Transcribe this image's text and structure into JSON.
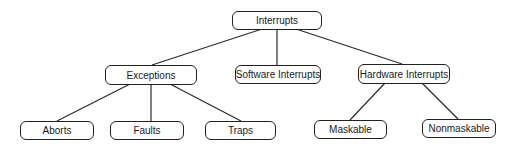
{
  "diagram": {
    "type": "tree",
    "root": {
      "label": "Interrupts",
      "children": [
        {
          "label": "Exceptions",
          "children": [
            {
              "label": "Aborts"
            },
            {
              "label": "Faults"
            },
            {
              "label": "Traps"
            }
          ]
        },
        {
          "label": "Software Interrupts"
        },
        {
          "label": "Hardware Interrupts",
          "children": [
            {
              "label": "Maskable"
            },
            {
              "label": "Nonmaskable"
            }
          ]
        }
      ]
    },
    "nodes": {
      "interrupts": "Interrupts",
      "exceptions": "Exceptions",
      "software_interrupts": "Software Interrupts",
      "hardware_interrupts": "Hardware Interrupts",
      "aborts": "Aborts",
      "faults": "Faults",
      "traps": "Traps",
      "maskable": "Maskable",
      "nonmaskable": "Nonmaskable"
    }
  }
}
